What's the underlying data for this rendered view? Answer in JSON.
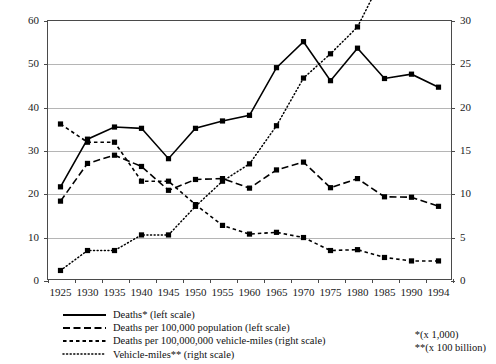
{
  "chart_data": {
    "type": "line",
    "title": "",
    "subtitle": "",
    "xlabel": "",
    "ylabel": "",
    "y2label": "",
    "grid": true,
    "legend_position": "bottom-left",
    "categories": [
      "1925",
      "1930",
      "1935",
      "1940",
      "1945",
      "1950",
      "1955",
      "1960",
      "1965",
      "1970",
      "1975",
      "1980",
      "1985",
      "1990",
      "1994"
    ],
    "ylim": [
      0,
      60
    ],
    "y2lim": [
      0,
      30
    ],
    "yticks": [
      0,
      10,
      20,
      30,
      40,
      50,
      60
    ],
    "y2ticks": [
      0,
      5,
      10,
      15,
      20,
      25,
      30
    ],
    "series": [
      {
        "name": "Deaths* (left scale)",
        "axis": "left",
        "style": "solid",
        "marker": "square",
        "values": [
          21.5,
          32.5,
          35.3,
          35.0,
          28.0,
          35.0,
          36.7,
          38.0,
          49.0,
          55.0,
          46.0,
          53.5,
          46.5,
          47.5,
          44.5
        ]
      },
      {
        "name": "Deaths per 100,000 population (left scale)",
        "axis": "left",
        "style": "long-dash",
        "marker": "square",
        "values": [
          18.2,
          26.9,
          28.8,
          26.2,
          20.7,
          23.2,
          23.4,
          21.2,
          25.4,
          27.2,
          21.3,
          23.4,
          19.2,
          19.1,
          17.0
        ]
      },
      {
        "name": "Deaths per 100,000,000 vehicle-miles (right scale)",
        "axis": "right",
        "style": "short-dash",
        "marker": "square",
        "values": [
          18.0,
          15.9,
          15.9,
          11.4,
          11.4,
          8.7,
          6.3,
          5.3,
          5.5,
          4.9,
          3.4,
          3.5,
          2.6,
          2.2,
          2.2
        ]
      },
      {
        "name": "Vehicle-miles** (right scale)",
        "axis": "right",
        "style": "dotted",
        "marker": "square",
        "values": [
          1.1,
          3.4,
          3.4,
          5.2,
          5.2,
          8.5,
          11.4,
          13.4,
          17.8,
          23.3,
          26.1,
          29.2,
          35.4,
          41.0,
          44.0
        ]
      }
    ],
    "legend": [
      "Deaths* (left scale)",
      "Deaths per 100,000 population (left scale)",
      "Deaths per 100,000,000 vehicle-miles (right scale)",
      "Vehicle-miles** (right scale)"
    ],
    "footnotes": [
      "*(x 1,000)",
      "**(x 100 billion)"
    ],
    "colors": {
      "series": "#000000",
      "grid": "#b5b5b5",
      "axis": "#4a4a4a",
      "text": "#111111"
    }
  }
}
